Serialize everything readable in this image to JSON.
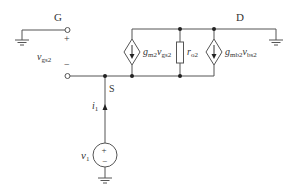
{
  "diagram": {
    "type": "small-signal equivalent circuit",
    "colors": {
      "wire": "#555555",
      "text": "#333333",
      "background": "#ffffff"
    },
    "nodes": {
      "gate": {
        "label": "G"
      },
      "drain": {
        "label": "D"
      },
      "source": {
        "label": "S"
      }
    },
    "terminal_voltage": {
      "name": "v",
      "sub": "gs2",
      "plus": "+",
      "minus": "−"
    },
    "components": {
      "dep_source_1": {
        "coef": "g",
        "coef_sub": "m2",
        "var": "v",
        "var_sub": "gs2"
      },
      "resistor": {
        "name": "r",
        "sub": "o2"
      },
      "dep_source_2": {
        "coef": "g",
        "coef_sub": "mb2",
        "var": "v",
        "var_sub": "bs2"
      },
      "test_source": {
        "name": "v",
        "sub": "1",
        "plus": "+",
        "minus": "−"
      },
      "test_current": {
        "name": "i",
        "sub": "1"
      }
    }
  }
}
